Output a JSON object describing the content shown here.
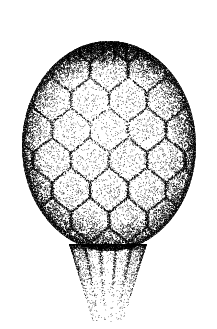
{
  "document": {
    "kind": "botanical-illustration",
    "technique": "stipple-engraving",
    "subject": "pine-cone",
    "title": "",
    "caption": "",
    "plate_number": "",
    "background_color": "#ffffff",
    "ink_color": "#000000",
    "canvas": {
      "width": 217,
      "height": 329
    }
  },
  "figure": {
    "name": "cone-with-stalk",
    "body": {
      "name": "cone-body",
      "shape": "ovoid",
      "center_x": 109,
      "center_y": 146,
      "radius_x": 87,
      "radius_y": 105,
      "top_y": 28,
      "bottom_y": 248,
      "left_x": 22,
      "right_x": 197,
      "widest_y": 150
    },
    "apex": {
      "name": "cone-apex",
      "center_x": 110,
      "center_y": 40,
      "width": 96,
      "height": 26,
      "tone": "dark",
      "description": "tight cluster of small dark compressed scales"
    },
    "stalk": {
      "name": "cone-stalk",
      "top_y": 244,
      "bottom_y": 322,
      "top_width": 78,
      "bottom_width": 30,
      "center_x": 108,
      "striation_count": 5,
      "fade": "bottom"
    },
    "scales": {
      "name": "scale-lattice",
      "pattern": "imbricate-rhombic",
      "rows": 8,
      "columns": 7,
      "row_offsets": [
        0,
        0.5,
        0,
        0.5,
        0,
        0.5,
        0,
        0.5
      ],
      "cell_width": 38,
      "cell_height": 30,
      "seam_tone": "#000000",
      "face_tone": "#ffffff"
    },
    "stipple": {
      "name": "stipple-field",
      "dot_min_radius": 0.28,
      "dot_max_radius": 0.72,
      "seed": 20240518,
      "density_outline": 0.95,
      "density_seam": 0.82,
      "density_face": 0.14,
      "density_rim_left": 0.62,
      "density_rim_right": 0.58,
      "total_dots_approx": 26000
    },
    "lighting": {
      "name": "lighting-model",
      "highlight_x": 96,
      "highlight_y": 120,
      "shadow_side": "left-and-right-rims",
      "description": "centre-lit, scales pale at the middle and dark at overlapping margins"
    }
  },
  "labels": {
    "annotations": []
  }
}
